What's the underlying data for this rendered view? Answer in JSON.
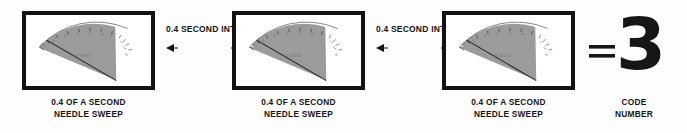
{
  "figure": {
    "background_color": "#fdfdfd",
    "ink_color": "#141414",
    "frame_color": "#121212",
    "sweep_fill_color": "#9a9a9a"
  },
  "panels": [
    {
      "id": "panel-1",
      "gauge_label": "DC VOLTS",
      "scale_ticks": [
        "0",
        "2",
        "4",
        "6",
        "8",
        "10"
      ],
      "caption_line_1": "0.4 OF A SECOND",
      "caption_line_2": "NEEDLE SWEEP"
    },
    {
      "id": "panel-2",
      "gauge_label": "DC VOLTS",
      "scale_ticks": [
        "0",
        "2",
        "4",
        "6",
        "8",
        "10"
      ],
      "caption_line_1": "0.4 OF A SECOND",
      "caption_line_2": "NEEDLE SWEEP"
    },
    {
      "id": "panel-3",
      "gauge_label": "DC VOLTS",
      "scale_ticks": [
        "0",
        "2",
        "4",
        "6",
        "8",
        "10"
      ],
      "caption_line_1": "0.4 OF A SECOND",
      "caption_line_2": "NEEDLE SWEEP"
    }
  ],
  "intervals": [
    {
      "id": "interval-1",
      "line_1": "0.4",
      "line_2": "SECOND",
      "line_3": "INTERVAL"
    },
    {
      "id": "interval-2",
      "line_1": "0.4",
      "line_2": "SECOND",
      "line_3": "INTERVAL"
    }
  ],
  "result": {
    "equals_symbol": "=",
    "code_number": "3",
    "caption_line_1": "CODE",
    "caption_line_2": "NUMBER"
  }
}
